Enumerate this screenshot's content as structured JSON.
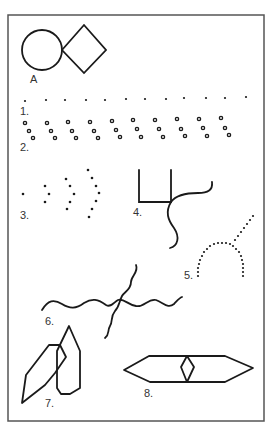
{
  "figure": {
    "colors": {
      "stroke": "#1a1a1a",
      "frame": "#555555",
      "background": "#ffffff",
      "label": "#333333"
    },
    "labels": {
      "a": "A",
      "one": "1.",
      "two": "2.",
      "three": "3.",
      "four": "4.",
      "five": "5.",
      "six": "6.",
      "seven": "7.",
      "eight": "8."
    },
    "items": [
      {
        "id": "A",
        "description": "circle touching a diamond"
      },
      {
        "id": "1",
        "description": "row of evenly spaced dots"
      },
      {
        "id": "2",
        "description": "row of diagonal triplets of small circles"
      },
      {
        "id": "3",
        "description": "dot, then nested dotted chevrons growing in size"
      },
      {
        "id": "4",
        "description": "open square with a wavy line crossing its corner"
      },
      {
        "id": "5",
        "description": "dotted arch with a dotted diagonal line"
      },
      {
        "id": "6",
        "description": "two crossing wavy lines"
      },
      {
        "id": "7",
        "description": "two overlapping elongated hexagons"
      },
      {
        "id": "8",
        "description": "long horizontal hexagon with a small diamond at center"
      }
    ]
  }
}
